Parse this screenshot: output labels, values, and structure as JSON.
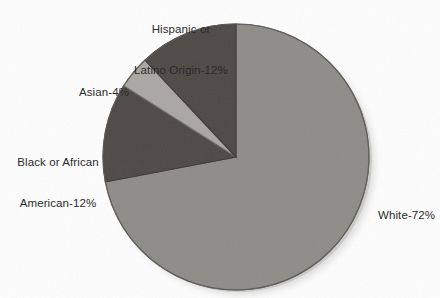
{
  "chart_data": {
    "type": "pie",
    "title": "",
    "categories": [
      "White",
      "Hispanic or Latino Origin",
      "Asian",
      "Black or African American"
    ],
    "values": [
      72,
      12,
      4,
      12
    ],
    "unit": "%",
    "legend_position": "callout-labels",
    "grid": false,
    "start_angle_deg": 0,
    "direction": "clockwise",
    "slices": [
      {
        "name": "White",
        "value": 72,
        "label": "White-72%",
        "color": "#8d8c87",
        "start_deg": 0,
        "end_deg": 259.2
      },
      {
        "name": "Black or African American",
        "value": 12,
        "label_line1": "Black or African",
        "label_line2": "American-12%",
        "color": "#4e4a45",
        "start_deg": 259.2,
        "end_deg": 302.4
      },
      {
        "name": "Asian",
        "value": 4,
        "label": "Asian-4%",
        "color": "#a9a7a1",
        "start_deg": 302.4,
        "end_deg": 316.8
      },
      {
        "name": "Hispanic or Latino Origin",
        "value": 12,
        "label_line1": "Hispanic or",
        "label_line2": "Latino Origin-12%",
        "color": "#4e4a45",
        "start_deg": 316.8,
        "end_deg": 360
      }
    ]
  },
  "labels": {
    "hispanic_line1": "Hispanic or",
    "hispanic_line2": "Latino Origin-12%",
    "asian": "Asian-4%",
    "black_line1": "Black or African",
    "black_line2": "American-12%",
    "white": "White-72%"
  },
  "colors": {
    "background": "#ffffff",
    "slice_dark": "#4e4a45",
    "slice_light": "#a9a7a1",
    "slice_mid": "#8d8c87",
    "outline": "#6b6761",
    "text": "#2b2b2b"
  }
}
